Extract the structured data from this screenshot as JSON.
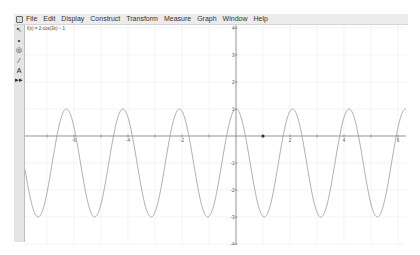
{
  "menubar": {
    "app_icon": "sketchpad-icon",
    "items": [
      "File",
      "Edit",
      "Display",
      "Construct",
      "Transform",
      "Measure",
      "Graph",
      "Window",
      "Help"
    ]
  },
  "toolbox": {
    "tools": [
      {
        "name": "arrow-tool",
        "glyph": "↖"
      },
      {
        "name": "point-tool",
        "glyph": "•"
      },
      {
        "name": "compass-tool",
        "glyph": "◎"
      },
      {
        "name": "straightedge-tool",
        "glyph": "⁄"
      },
      {
        "name": "text-tool",
        "glyph": "A"
      },
      {
        "name": "custom-tool",
        "glyph": "▸▸"
      }
    ]
  },
  "graph": {
    "function_label": "f(x) = 2·cos(3x) − 1",
    "x_tick_labels": [
      "-6",
      "-4",
      "-2",
      "2",
      "4",
      "6"
    ],
    "y_tick_labels": [
      "4",
      "3",
      "2",
      "1",
      "-1",
      "-2",
      "-3",
      "-4"
    ],
    "point": {
      "x": 1,
      "y": 0
    },
    "colors": {
      "curve": "#9a9a9a",
      "axis": "#707070",
      "grid": "#ececec",
      "point": "#333333"
    }
  }
}
